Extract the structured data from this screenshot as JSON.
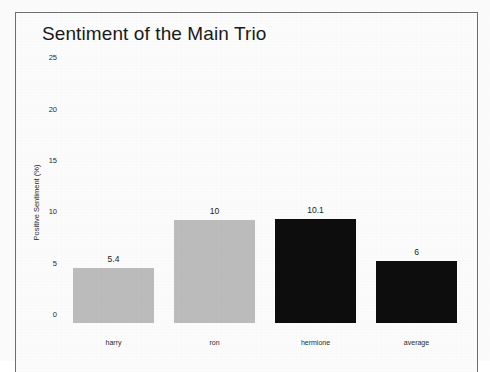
{
  "chart_data": {
    "type": "bar",
    "title": "Sentiment of the Main Trio",
    "xlabel": "",
    "ylabel": "Positive Sentiment (%)",
    "categories": [
      "harry",
      "ron",
      "hermione",
      "average"
    ],
    "values": [
      5.4,
      10,
      10.1,
      6
    ],
    "value_labels": [
      "5.4",
      "10",
      "10.1",
      "6"
    ],
    "bar_colors": [
      "#bcbcbc",
      "#bcbcbc",
      "#0d0d0d",
      "#0d0d0d"
    ],
    "ylim": [
      0,
      26.5
    ],
    "yticks": [
      0,
      5,
      10,
      15,
      20,
      25
    ],
    "ytick_labels": [
      "0",
      "5",
      "10",
      "15",
      "20",
      "25"
    ],
    "grid": false,
    "legend": null,
    "legend_position": "none"
  },
  "figure": {
    "background_color": "#fcfcfc",
    "frame_color": "#6e6e70",
    "title_color": "#1a1a1a"
  }
}
